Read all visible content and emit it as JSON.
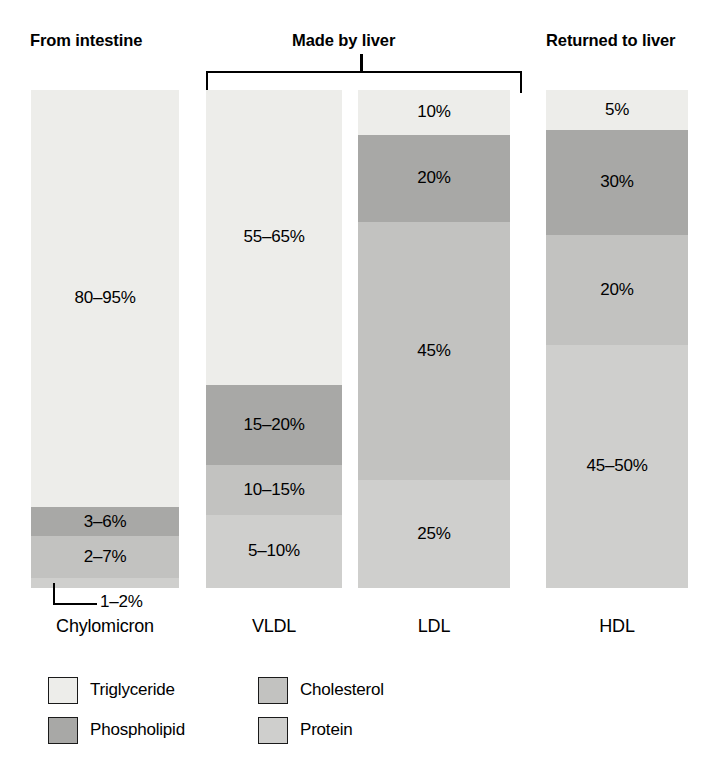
{
  "headings": {
    "intestine": "From intestine",
    "liver": "Made by liver",
    "returned": "Returned to liver"
  },
  "colors": {
    "triglyceride": "#ededea",
    "phospholipid": "#a8a8a6",
    "cholesterol": "#c2c2c0",
    "protein": "#cfcfcd",
    "outline": "#1a1a1a",
    "background": "#ffffff"
  },
  "legend": {
    "items": [
      {
        "label": "Triglyceride",
        "color": "#ededea"
      },
      {
        "label": "Cholesterol",
        "color": "#c2c2c0"
      },
      {
        "label": "Phospholipid",
        "color": "#a8a8a6"
      },
      {
        "label": "Protein",
        "color": "#cfcfcd"
      }
    ]
  },
  "chylomicron_callout": "1–2%",
  "chart_data": {
    "type": "bar",
    "subtype": "stacked-100-percent",
    "title": "",
    "xlabel": "",
    "ylabel": "",
    "ylim": [
      0,
      100
    ],
    "grid": false,
    "legend_position": "bottom-left",
    "categories": [
      "Chylomicron",
      "VLDL",
      "LDL",
      "HDL"
    ],
    "group_labels": {
      "Chylomicron": "From intestine",
      "VLDL": "Made by liver",
      "LDL": "Made by liver",
      "HDL": "Returned to liver"
    },
    "series": [
      {
        "name": "Triglyceride",
        "color": "#ededea",
        "values": [
          87.5,
          60,
          10,
          5
        ],
        "labels": [
          "80–95%",
          "55–65%",
          "10%",
          "5%"
        ]
      },
      {
        "name": "Phospholipid",
        "color": "#a8a8a6",
        "values": [
          4.5,
          17.5,
          20,
          30
        ],
        "labels": [
          "3–6%",
          "15–20%",
          "20%",
          "30%"
        ]
      },
      {
        "name": "Cholesterol",
        "color": "#c2c2c0",
        "values": [
          4.5,
          12.5,
          45,
          20
        ],
        "labels": [
          "2–7%",
          "10–15%",
          "45%",
          "20%"
        ]
      },
      {
        "name": "Protein",
        "color": "#cfcfcd",
        "values": [
          1.5,
          7.5,
          25,
          47.5
        ],
        "labels": [
          "1–2%",
          "5–10%",
          "25%",
          "45–50%"
        ]
      }
    ],
    "bars": {
      "chylomicron": {
        "label": "Chylomicron",
        "segments": [
          {
            "component": "Triglyceride",
            "label": "80–95%",
            "height_pct": 83.7
          },
          {
            "component": "Phospholipid",
            "label": "3–6%",
            "height_pct": 5.9
          },
          {
            "component": "Cholesterol",
            "label": "2–7%",
            "height_pct": 8.4
          },
          {
            "component": "Protein",
            "label": "1–2%",
            "height_pct": 2.0
          }
        ]
      },
      "vldl": {
        "label": "VLDL",
        "segments": [
          {
            "component": "Triglyceride",
            "label": "55–65%",
            "height_pct": 59.2
          },
          {
            "component": "Phospholipid",
            "label": "15–20%",
            "height_pct": 16.1
          },
          {
            "component": "Cholesterol",
            "label": "10–15%",
            "height_pct": 10.0
          },
          {
            "component": "Protein",
            "label": "5–10%",
            "height_pct": 14.7
          }
        ]
      },
      "ldl": {
        "label": "LDL",
        "segments": [
          {
            "component": "Triglyceride",
            "label": "10%",
            "height_pct": 9.0
          },
          {
            "component": "Phospholipid",
            "label": "20%",
            "height_pct": 17.5
          },
          {
            "component": "Cholesterol",
            "label": "45%",
            "height_pct": 51.8
          },
          {
            "component": "Protein",
            "label": "25%",
            "height_pct": 21.7
          }
        ]
      },
      "hdl": {
        "label": "HDL",
        "segments": [
          {
            "component": "Triglyceride",
            "label": "5%",
            "height_pct": 8.0
          },
          {
            "component": "Phospholipid",
            "label": "30%",
            "height_pct": 21.1
          },
          {
            "component": "Cholesterol",
            "label": "20%",
            "height_pct": 22.1
          },
          {
            "component": "Protein",
            "label": "45–50%",
            "height_pct": 48.8
          }
        ]
      }
    }
  }
}
